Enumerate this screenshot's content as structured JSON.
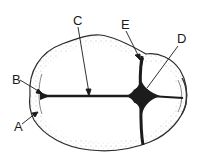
{
  "diagram": {
    "labels": [
      {
        "id": "A",
        "text": "A",
        "x": 14,
        "y": 131
      },
      {
        "id": "B",
        "text": "B",
        "x": 12,
        "y": 84
      },
      {
        "id": "C",
        "text": "C",
        "x": 73,
        "y": 25
      },
      {
        "id": "D",
        "text": "D",
        "x": 177,
        "y": 43
      },
      {
        "id": "E",
        "text": "E",
        "x": 121,
        "y": 29
      }
    ],
    "colors": {
      "outline": "#2a2a2a",
      "suture": "#1c1c1c",
      "fill": "#ffffff",
      "stipple": "#6a6a6a"
    }
  }
}
